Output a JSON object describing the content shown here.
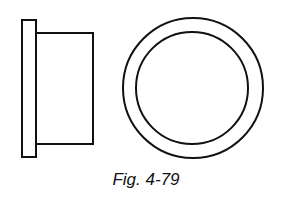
{
  "figure": {
    "caption": "Fig. 4-79",
    "stroke_color": "#111111",
    "views": [
      {
        "name": "side-view",
        "parts": [
          "flange",
          "body"
        ]
      },
      {
        "name": "end-view",
        "parts": [
          "outer-circle",
          "inner-circle"
        ]
      }
    ]
  }
}
